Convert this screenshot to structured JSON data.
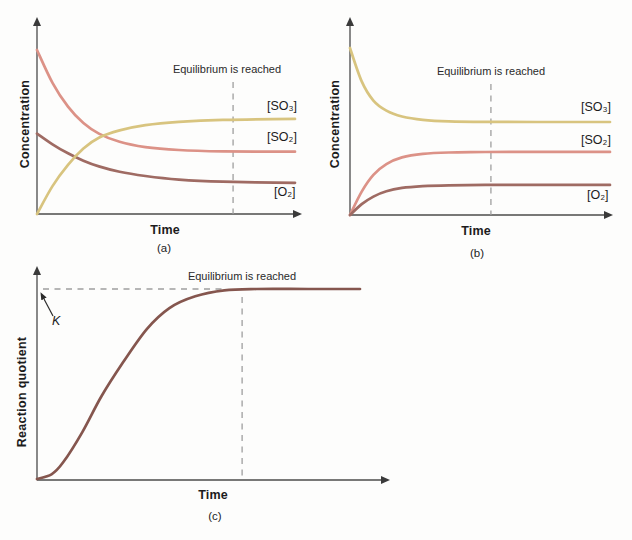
{
  "figure": {
    "colors": {
      "so2": "#dc9287",
      "so3": "#d8c47f",
      "o2": "#9f6b63",
      "quotient": "#85564e",
      "axis": "#4b4b4b",
      "dashed": "#9e9e9e",
      "text": "#1c1c1c"
    },
    "panels": {
      "a": {
        "caption": "(a)",
        "x_label": "Time",
        "y_label": "Concentration",
        "annotation": "Equilibrium is reached",
        "labels": {
          "so3": "[SO₃]",
          "so2": "[SO₂]",
          "o2": "[O₂]"
        }
      },
      "b": {
        "caption": "(b)",
        "x_label": "Time",
        "y_label": "Concentration",
        "annotation": "Equilibrium is reached",
        "labels": {
          "so3": "[SO₃]",
          "so2": "[SO₂]",
          "o2": "[O₂]"
        }
      },
      "c": {
        "caption": "(c)",
        "x_label": "Time",
        "y_label": "Reaction quotient",
        "annotation": "Equilibrium is reached",
        "k_label": "K"
      }
    }
  },
  "chart_data": [
    {
      "panel": "a",
      "type": "line",
      "title": "",
      "xlabel": "Time",
      "ylabel": "Concentration",
      "ticks": "none",
      "x_range_frac": [
        0,
        1
      ],
      "y_unit": "relative concentration (1.0 = initial [SO2])",
      "equilibrium_line": {
        "text": "Equilibrium is reached",
        "x_frac": 0.76
      },
      "series": [
        {
          "name": "SO2",
          "label": "[SO₂]",
          "color_key": "so2",
          "points": [
            [
              0,
              1.0
            ],
            [
              0.06,
              0.8
            ],
            [
              0.12,
              0.655
            ],
            [
              0.18,
              0.555
            ],
            [
              0.24,
              0.49
            ],
            [
              0.32,
              0.44
            ],
            [
              0.42,
              0.408
            ],
            [
              0.55,
              0.39
            ],
            [
              0.72,
              0.382
            ],
            [
              1,
              0.38
            ]
          ]
        },
        {
          "name": "O2",
          "label": "[O₂]",
          "color_key": "o2",
          "points": [
            [
              0,
              0.49
            ],
            [
              0.06,
              0.425
            ],
            [
              0.12,
              0.37
            ],
            [
              0.18,
              0.325
            ],
            [
              0.24,
              0.29
            ],
            [
              0.32,
              0.258
            ],
            [
              0.42,
              0.232
            ],
            [
              0.55,
              0.21
            ],
            [
              0.72,
              0.197
            ],
            [
              1,
              0.19
            ]
          ]
        },
        {
          "name": "SO3",
          "label": "[SO₃]",
          "color_key": "so3",
          "points": [
            [
              0,
              0.0
            ],
            [
              0.06,
              0.17
            ],
            [
              0.12,
              0.3
            ],
            [
              0.18,
              0.4
            ],
            [
              0.24,
              0.465
            ],
            [
              0.32,
              0.51
            ],
            [
              0.42,
              0.542
            ],
            [
              0.55,
              0.562
            ],
            [
              0.72,
              0.574
            ],
            [
              1,
              0.58
            ]
          ]
        }
      ]
    },
    {
      "panel": "b",
      "type": "line",
      "title": "",
      "xlabel": "Time",
      "ylabel": "Concentration",
      "ticks": "none",
      "x_range_frac": [
        0,
        1
      ],
      "y_unit": "relative concentration (1.0 = initial [SO3])",
      "equilibrium_line": {
        "text": "Equilibrium is reached",
        "x_frac": 0.542
      },
      "series": [
        {
          "name": "SO3",
          "label": "[SO₃]",
          "color_key": "so3",
          "points": [
            [
              0,
              1.0
            ],
            [
              0.045,
              0.8
            ],
            [
              0.09,
              0.685
            ],
            [
              0.14,
              0.625
            ],
            [
              0.2,
              0.59
            ],
            [
              0.28,
              0.57
            ],
            [
              0.38,
              0.561
            ],
            [
              0.52,
              0.558
            ],
            [
              0.72,
              0.557
            ],
            [
              1,
              0.557
            ]
          ]
        },
        {
          "name": "SO2",
          "label": "[SO₂]",
          "color_key": "so2",
          "points": [
            [
              0,
              0.0
            ],
            [
              0.045,
              0.14
            ],
            [
              0.09,
              0.24
            ],
            [
              0.14,
              0.305
            ],
            [
              0.2,
              0.345
            ],
            [
              0.28,
              0.366
            ],
            [
              0.38,
              0.374
            ],
            [
              0.52,
              0.377
            ],
            [
              0.72,
              0.378
            ],
            [
              1,
              0.378
            ]
          ]
        },
        {
          "name": "O2",
          "label": "[O₂]",
          "color_key": "o2",
          "points": [
            [
              0,
              0.0
            ],
            [
              0.045,
              0.065
            ],
            [
              0.09,
              0.11
            ],
            [
              0.14,
              0.142
            ],
            [
              0.2,
              0.162
            ],
            [
              0.28,
              0.173
            ],
            [
              0.38,
              0.178
            ],
            [
              0.52,
              0.18
            ],
            [
              0.72,
              0.18
            ],
            [
              1,
              0.18
            ]
          ]
        }
      ]
    },
    {
      "panel": "c",
      "type": "line",
      "title": "",
      "xlabel": "Time",
      "ylabel": "Reaction quotient",
      "ticks": "none",
      "x_range_frac": [
        0,
        1
      ],
      "y_unit": "reaction quotient Q (1.0 = K)",
      "equilibrium_line": {
        "text": "Equilibrium is reached",
        "x_frac": 0.635
      },
      "k_line": {
        "label": "K",
        "value": 1.0,
        "x_end_frac": 0.58
      },
      "series": [
        {
          "name": "Q",
          "label": "Q",
          "color_key": "quotient",
          "points": [
            [
              0,
              0.005
            ],
            [
              0.045,
              0.03
            ],
            [
              0.08,
              0.09
            ],
            [
              0.14,
              0.25
            ],
            [
              0.2,
              0.44
            ],
            [
              0.266,
              0.615
            ],
            [
              0.34,
              0.79
            ],
            [
              0.41,
              0.9
            ],
            [
              0.49,
              0.962
            ],
            [
              0.58,
              0.993
            ],
            [
              0.68,
              1.0
            ],
            [
              0.84,
              1.0
            ],
            [
              1,
              1.0
            ]
          ]
        }
      ]
    }
  ]
}
